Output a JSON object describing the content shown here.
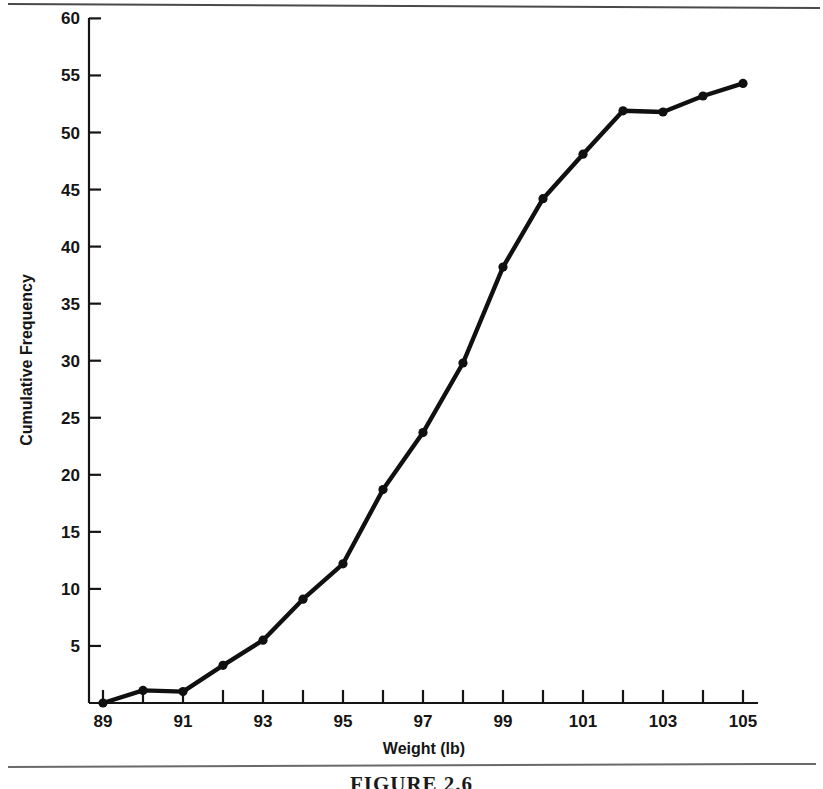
{
  "figure": {
    "caption": "FIGURE 2.6"
  },
  "chart_data": {
    "type": "line",
    "title": "",
    "subtitle": "",
    "xlabel": "Weight (lb)",
    "ylabel": "Cumulative Frequency",
    "xlim": [
      88.5,
      105.8
    ],
    "ylim": [
      0,
      60
    ],
    "grid": false,
    "legend": null,
    "marker": "filled-circle",
    "line_color": "#101010",
    "marker_color": "#101010",
    "x_major_ticks": [
      89,
      90,
      91,
      92,
      93,
      94,
      95,
      96,
      97,
      98,
      99,
      100,
      101,
      102,
      103,
      104,
      105
    ],
    "x_tick_labels": [
      "89",
      "",
      "91",
      "",
      "93",
      "",
      "95",
      "",
      "97",
      "",
      "99",
      "",
      "101",
      "",
      "103",
      "",
      "105"
    ],
    "y_major_ticks": [
      5,
      10,
      15,
      20,
      25,
      30,
      35,
      40,
      45,
      50,
      55,
      60
    ],
    "y_tick_labels": [
      "5",
      "10",
      "15",
      "20",
      "25",
      "30",
      "35",
      "40",
      "45",
      "50",
      "55",
      "60"
    ],
    "x": [
      89,
      90,
      91,
      92,
      93,
      94,
      95,
      96,
      97,
      98,
      99,
      100,
      101,
      102,
      103,
      104
    ],
    "values": [
      0,
      1.1,
      1.0,
      3.3,
      5.5,
      9.1,
      12.2,
      18.7,
      23.7,
      29.8,
      38.2,
      44.2,
      48.1,
      51.9,
      51.8,
      53.2
    ],
    "series": [
      {
        "name": "Cumulative Frequency",
        "points": [
          {
            "x": 89,
            "y": 0
          },
          {
            "x": 90,
            "y": 1.1
          },
          {
            "x": 91,
            "y": 1.0
          },
          {
            "x": 92,
            "y": 3.3
          },
          {
            "x": 93,
            "y": 5.5
          },
          {
            "x": 94,
            "y": 9.1
          },
          {
            "x": 95,
            "y": 12.2
          },
          {
            "x": 96,
            "y": 18.7
          },
          {
            "x": 97,
            "y": 23.7
          },
          {
            "x": 98,
            "y": 29.8
          },
          {
            "x": 99,
            "y": 38.2
          },
          {
            "x": 100,
            "y": 44.2
          },
          {
            "x": 101,
            "y": 48.1
          },
          {
            "x": 102,
            "y": 51.9
          },
          {
            "x": 103,
            "y": 51.8
          },
          {
            "x": 104,
            "y": 53.2
          },
          {
            "x": 105,
            "y": 54.3
          }
        ]
      }
    ]
  }
}
